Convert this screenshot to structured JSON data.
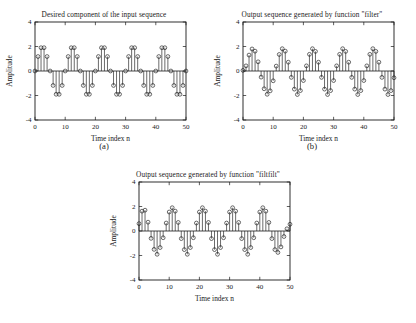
{
  "figure": {
    "background": "#ffffff",
    "ink_color": "#1a1a1a",
    "panels": [
      "a",
      "b",
      "c"
    ]
  },
  "panel_a": {
    "subfig_label": "(a)",
    "chart_data": {
      "type": "line",
      "plot_style": "stem",
      "title": "Desired component of the input sequence",
      "xlabel": "Time index n",
      "ylabel": "Amplitude",
      "xlim": [
        0,
        50
      ],
      "ylim": [
        -4,
        4
      ],
      "xticks": [
        0,
        10,
        20,
        30,
        40,
        50
      ],
      "yticks": [
        -4,
        -2,
        0,
        2,
        4
      ],
      "xtick_labels": [
        "0",
        "10",
        "20",
        "30",
        "40",
        "50"
      ],
      "ytick_labels": [
        "-4",
        "-2",
        "0",
        "2",
        "4"
      ],
      "grid": false,
      "legend": "none",
      "marker": "circle",
      "x": [
        0,
        1,
        2,
        3,
        4,
        5,
        6,
        7,
        8,
        9,
        10,
        11,
        12,
        13,
        14,
        15,
        16,
        17,
        18,
        19,
        20,
        21,
        22,
        23,
        24,
        25,
        26,
        27,
        28,
        29,
        30,
        31,
        32,
        33,
        34,
        35,
        36,
        37,
        38,
        39,
        40,
        41,
        42,
        43,
        44,
        45,
        46,
        47,
        48,
        49,
        50
      ],
      "y": [
        0.0,
        1.18,
        1.9,
        1.9,
        1.18,
        0.0,
        -1.18,
        -1.9,
        -1.9,
        -1.18,
        0.0,
        1.18,
        1.9,
        1.9,
        1.18,
        0.0,
        -1.18,
        -1.9,
        -1.9,
        -1.18,
        0.0,
        1.18,
        1.9,
        1.9,
        1.18,
        0.0,
        -1.18,
        -1.9,
        -1.9,
        -1.18,
        0.0,
        1.18,
        1.9,
        1.9,
        1.18,
        0.0,
        -1.18,
        -1.9,
        -1.9,
        -1.18,
        0.0,
        1.18,
        1.9,
        1.9,
        1.18,
        0.0,
        -1.18,
        -1.9,
        -1.9,
        -1.18,
        0.0
      ]
    }
  },
  "panel_b": {
    "subfig_label": "(b)",
    "chart_data": {
      "type": "line",
      "plot_style": "stem",
      "title": "Output sequence generated by function \"filter\"",
      "xlabel": "Time index n",
      "ylabel": "Amplitude",
      "xlim": [
        0,
        50
      ],
      "ylim": [
        -4,
        4
      ],
      "xticks": [
        0,
        10,
        20,
        30,
        40,
        50
      ],
      "yticks": [
        -4,
        -2,
        0,
        2,
        4
      ],
      "xtick_labels": [
        "0",
        "10",
        "20",
        "30",
        "40",
        "50"
      ],
      "ytick_labels": [
        "-4",
        "-2",
        "0",
        "2",
        "4"
      ],
      "grid": false,
      "legend": "none",
      "marker": "circle",
      "x": [
        0,
        1,
        2,
        3,
        4,
        5,
        6,
        7,
        8,
        9,
        10,
        11,
        12,
        13,
        14,
        15,
        16,
        17,
        18,
        19,
        20,
        21,
        22,
        23,
        24,
        25,
        26,
        27,
        28,
        29,
        30,
        31,
        32,
        33,
        34,
        35,
        36,
        37,
        38,
        39,
        40,
        41,
        42,
        43,
        44,
        45,
        46,
        47,
        48,
        49,
        50
      ],
      "y": [
        0.05,
        0.42,
        1.3,
        1.8,
        1.62,
        0.75,
        -0.5,
        -1.45,
        -1.9,
        -1.62,
        -0.8,
        0.4,
        1.35,
        1.82,
        1.62,
        0.72,
        -0.52,
        -1.48,
        -1.92,
        -1.6,
        -0.78,
        0.42,
        1.36,
        1.82,
        1.6,
        0.72,
        -0.52,
        -1.48,
        -1.92,
        -1.6,
        -0.78,
        0.42,
        1.36,
        1.82,
        1.6,
        0.72,
        -0.52,
        -1.48,
        -1.92,
        -1.6,
        -0.78,
        0.42,
        1.36,
        1.82,
        1.6,
        0.72,
        -0.52,
        -1.48,
        -1.92,
        -1.6,
        -0.55
      ]
    }
  },
  "panel_c": {
    "subfig_label": "(c)",
    "chart_data": {
      "type": "line",
      "plot_style": "stem",
      "title": "Output sequence generated by function \"filtfilt\"",
      "xlabel": "Time index n",
      "ylabel": "Amplitude",
      "xlim": [
        0,
        50
      ],
      "ylim": [
        -4,
        4
      ],
      "xticks": [
        0,
        10,
        20,
        30,
        40,
        50
      ],
      "yticks": [
        -4,
        -2,
        0,
        2,
        4
      ],
      "xtick_labels": [
        "0",
        "10",
        "20",
        "30",
        "40",
        "50"
      ],
      "ytick_labels": [
        "-4",
        "-2",
        "0",
        "2",
        "4"
      ],
      "grid": false,
      "legend": "none",
      "marker": "circle",
      "x": [
        0,
        1,
        2,
        3,
        4,
        5,
        6,
        7,
        8,
        9,
        10,
        11,
        12,
        13,
        14,
        15,
        16,
        17,
        18,
        19,
        20,
        21,
        22,
        23,
        24,
        25,
        26,
        27,
        28,
        29,
        30,
        31,
        32,
        33,
        34,
        35,
        36,
        37,
        38,
        39,
        40,
        41,
        42,
        43,
        44,
        45,
        46,
        47,
        48,
        49,
        50
      ],
      "y": [
        0.6,
        1.62,
        1.7,
        0.72,
        -0.6,
        -1.5,
        -1.9,
        -1.35,
        -0.55,
        0.65,
        1.55,
        1.9,
        1.62,
        0.7,
        -0.62,
        -1.52,
        -1.9,
        -1.35,
        -0.55,
        0.65,
        1.55,
        1.9,
        1.62,
        0.7,
        -0.62,
        -1.52,
        -1.9,
        -1.35,
        -0.55,
        0.65,
        1.55,
        1.9,
        1.62,
        0.7,
        -0.62,
        -1.52,
        -1.9,
        -1.35,
        -0.55,
        0.65,
        1.55,
        1.9,
        1.62,
        0.7,
        -0.62,
        -1.52,
        -1.75,
        -1.3,
        -0.45,
        0.18,
        0.55
      ]
    }
  }
}
